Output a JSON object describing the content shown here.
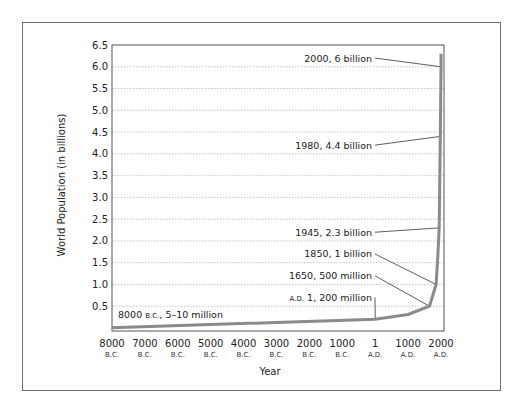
{
  "chart_data": {
    "type": "line",
    "title": "",
    "xlabel": "Year",
    "ylabel": "World Population (in billions)",
    "xlim": [
      -8000,
      2000
    ],
    "ylim": [
      0,
      6.5
    ],
    "grid": "horizontal-dotted",
    "x_ticks": [
      {
        "value": -8000,
        "label": "8000",
        "era": "B.C."
      },
      {
        "value": -7000,
        "label": "7000",
        "era": "B.C."
      },
      {
        "value": -6000,
        "label": "6000",
        "era": "B.C."
      },
      {
        "value": -5000,
        "label": "5000",
        "era": "B.C."
      },
      {
        "value": -4000,
        "label": "4000",
        "era": "B.C."
      },
      {
        "value": -3000,
        "label": "3000",
        "era": "B.C."
      },
      {
        "value": -2000,
        "label": "2000",
        "era": "B.C."
      },
      {
        "value": -1000,
        "label": "1000",
        "era": "B.C."
      },
      {
        "value": 1,
        "label": "1",
        "era": "A.D."
      },
      {
        "value": 1000,
        "label": "1000",
        "era": "A.D."
      },
      {
        "value": 2000,
        "label": "2000",
        "era": "A.D."
      }
    ],
    "y_ticks": [
      {
        "value": 0.5,
        "label": "0.5"
      },
      {
        "value": 1.0,
        "label": "1.0"
      },
      {
        "value": 1.5,
        "label": "1.5"
      },
      {
        "value": 2.0,
        "label": "2.0"
      },
      {
        "value": 2.5,
        "label": "2.5"
      },
      {
        "value": 3.0,
        "label": "3.0"
      },
      {
        "value": 3.5,
        "label": "3.5"
      },
      {
        "value": 4.0,
        "label": "4.0"
      },
      {
        "value": 4.5,
        "label": "4.5"
      },
      {
        "value": 5.0,
        "label": "5.0"
      },
      {
        "value": 5.5,
        "label": "5.5"
      },
      {
        "value": 6.0,
        "label": "6.0"
      },
      {
        "value": 6.5,
        "label": "6.5"
      }
    ],
    "series": [
      {
        "name": "World Population",
        "color": "#8a8a8a",
        "points": [
          {
            "x": -8000,
            "y": 0.0075
          },
          {
            "x": 1,
            "y": 0.2
          },
          {
            "x": 1000,
            "y": 0.31
          },
          {
            "x": 1650,
            "y": 0.5
          },
          {
            "x": 1850,
            "y": 1.0
          },
          {
            "x": 1900,
            "y": 1.6
          },
          {
            "x": 1945,
            "y": 2.3
          },
          {
            "x": 1980,
            "y": 4.4
          },
          {
            "x": 2000,
            "y": 6.0
          },
          {
            "x": 2005,
            "y": 6.3
          }
        ]
      }
    ],
    "annotations": [
      {
        "text": "2000, 6 billion",
        "prefix": "",
        "x": 2000,
        "y": 6.0,
        "label_y": 6.2
      },
      {
        "text": "1980, 4.4 billion",
        "prefix": "",
        "x": 1980,
        "y": 4.4,
        "label_y": 4.2
      },
      {
        "text": "1945, 2.3 billion",
        "prefix": "",
        "x": 1945,
        "y": 2.3,
        "label_y": 2.2
      },
      {
        "text": "1850, 1 billion",
        "prefix": "",
        "x": 1850,
        "y": 1.0,
        "label_y": 1.7
      },
      {
        "text": " 500 million",
        "prefix": "1650,",
        "x": 1650,
        "y": 0.5,
        "label_y": 1.2
      },
      {
        "text": " 1, 200 million",
        "prefix": "A.D.",
        "x": 1,
        "y": 0.2,
        "label_y": 0.7
      },
      {
        "text": ", 5–10 million",
        "prefix": "8000 B.C.",
        "x": -8000,
        "y": 0.0075,
        "label_y": 0.3
      }
    ]
  }
}
